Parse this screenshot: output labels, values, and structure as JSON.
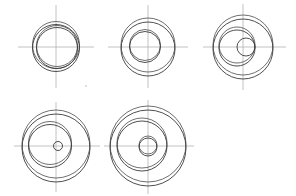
{
  "document": {
    "title": "Eccentric Circles Construction Sheet",
    "canvas_width": 296,
    "canvas_height": 196,
    "background_color": "#ffffff",
    "stroke_color": "#3a3a3a",
    "ghost_stroke_color": "#555555",
    "axis_color": "#b3b3b3",
    "speck_color": "#cfcfcf",
    "figure_count": 5,
    "row_counts": [
      3,
      2
    ]
  },
  "figures": [
    {
      "id": "figure-1",
      "label": "Figure 1",
      "row": 1,
      "column": 1,
      "center": {
        "x": 56,
        "y": 47
      },
      "axis": {
        "horizontal": {
          "x1": 18,
          "x2": 94,
          "y": 47
        },
        "vertical": {
          "y1": 5,
          "y2": 88,
          "x": 56
        }
      },
      "circles": [
        {
          "name": "outer-ring-upper",
          "cx": 56,
          "cy": 45,
          "r": 23.5,
          "kind": "ghost"
        },
        {
          "name": "outer-ring-lower",
          "cx": 56,
          "cy": 48,
          "r": 23.5,
          "kind": "solid"
        },
        {
          "name": "inner-bore-upper",
          "cx": 57,
          "cy": 46,
          "r": 20.5,
          "kind": "ghost"
        },
        {
          "name": "inner-bore-lower",
          "cx": 57,
          "cy": 48,
          "r": 20.5,
          "kind": "solid"
        }
      ]
    },
    {
      "id": "figure-2",
      "label": "Figure 2",
      "row": 1,
      "column": 2,
      "center": {
        "x": 148,
        "y": 47
      },
      "axis": {
        "horizontal": {
          "x1": 108,
          "x2": 188,
          "y": 47
        },
        "vertical": {
          "y1": 5,
          "y2": 88,
          "x": 148
        }
      },
      "circles": [
        {
          "name": "outer-ring-upper",
          "cx": 148,
          "cy": 45,
          "r": 27,
          "kind": "ghost"
        },
        {
          "name": "outer-ring-lower",
          "cx": 148,
          "cy": 49,
          "r": 27,
          "kind": "solid"
        },
        {
          "name": "inner-bore-upper",
          "cx": 145,
          "cy": 45,
          "r": 15.5,
          "kind": "ghost"
        },
        {
          "name": "inner-bore-lower",
          "cx": 145,
          "cy": 47,
          "r": 15.5,
          "kind": "solid"
        }
      ]
    },
    {
      "id": "figure-3",
      "label": "Figure 3",
      "row": 1,
      "column": 3,
      "center": {
        "x": 243,
        "y": 47
      },
      "axis": {
        "horizontal": {
          "x1": 203,
          "x2": 286,
          "y": 47
        },
        "vertical": {
          "y1": 4,
          "y2": 90,
          "x": 243
        }
      },
      "circles": [
        {
          "name": "outer-ring-upper",
          "cx": 243,
          "cy": 45,
          "r": 30,
          "kind": "ghost"
        },
        {
          "name": "outer-ring-lower",
          "cx": 243,
          "cy": 49,
          "r": 30,
          "kind": "solid"
        },
        {
          "name": "mid-ring-upper",
          "cx": 237,
          "cy": 45,
          "r": 18,
          "kind": "ghost"
        },
        {
          "name": "mid-ring-lower",
          "cx": 237,
          "cy": 48,
          "r": 18,
          "kind": "solid"
        },
        {
          "name": "small-bore",
          "cx": 246,
          "cy": 47,
          "r": 9,
          "kind": "solid"
        }
      ]
    },
    {
      "id": "figure-4",
      "label": "Figure 4",
      "row": 2,
      "column": 1,
      "center": {
        "x": 56,
        "y": 146
      },
      "axis": {
        "horizontal": {
          "x1": 14,
          "x2": 100,
          "y": 146
        },
        "vertical": {
          "y1": 102,
          "y2": 192,
          "x": 56
        }
      },
      "circles": [
        {
          "name": "outer-ring-upper",
          "cx": 56,
          "cy": 144,
          "r": 34,
          "kind": "ghost"
        },
        {
          "name": "outer-ring-lower",
          "cx": 56,
          "cy": 148,
          "r": 34,
          "kind": "solid"
        },
        {
          "name": "mid-ring-upper",
          "cx": 50,
          "cy": 143,
          "r": 21.5,
          "kind": "ghost"
        },
        {
          "name": "mid-ring-lower",
          "cx": 50,
          "cy": 146,
          "r": 21.5,
          "kind": "solid"
        },
        {
          "name": "small-bore",
          "cx": 58,
          "cy": 146,
          "r": 4.5,
          "kind": "solid"
        }
      ]
    },
    {
      "id": "figure-5",
      "label": "Figure 5",
      "row": 2,
      "column": 2,
      "center": {
        "x": 148,
        "y": 146
      },
      "axis": {
        "horizontal": {
          "x1": 104,
          "x2": 194,
          "y": 146
        },
        "vertical": {
          "y1": 100,
          "y2": 194,
          "x": 148
        }
      },
      "circles": [
        {
          "name": "outer-ring-upper",
          "cx": 148,
          "cy": 144,
          "r": 38,
          "kind": "ghost"
        },
        {
          "name": "outer-ring-lower",
          "cx": 148,
          "cy": 148,
          "r": 38,
          "kind": "solid"
        },
        {
          "name": "mid-ring-upper",
          "cx": 142,
          "cy": 143,
          "r": 25,
          "kind": "ghost"
        },
        {
          "name": "mid-ring-lower",
          "cx": 142,
          "cy": 146,
          "r": 25,
          "kind": "solid"
        },
        {
          "name": "small-bore-upper",
          "cx": 148,
          "cy": 145,
          "r": 9,
          "kind": "ghost"
        },
        {
          "name": "small-bore-lower",
          "cx": 148,
          "cy": 147,
          "r": 9,
          "kind": "solid"
        }
      ]
    }
  ],
  "marks": [
    {
      "name": "stray-speck",
      "cx": 86,
      "cy": 86,
      "r": 0.9
    }
  ]
}
